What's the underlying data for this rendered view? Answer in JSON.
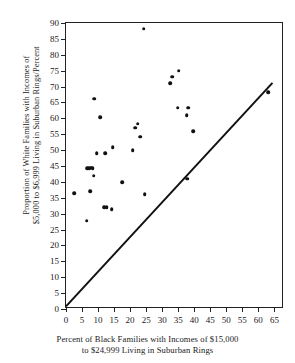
{
  "chart_data": {
    "type": "scatter",
    "title": "",
    "xlabel": "Percent of Black Families with Incomes of $15,000 to $24,999 Living in Suburban Rings",
    "xlabel_line1": "Percent of Black Families with Incomes of $15,000",
    "xlabel_line2": "to $24,999 Living in Suburban Rings",
    "ylabel": "Proportion of White Families with Incomes of $5,000 to $6,999 Living in Suburban Rings/Percent",
    "ylabel_line1": "Proportion of White Families with Incomes of",
    "ylabel_line2": "$5,000 to $6,999 Living in Suburban Rings/Percent",
    "xlim": [
      0,
      68
    ],
    "ylim": [
      0,
      90
    ],
    "xticks": [
      0,
      5,
      10,
      15,
      20,
      25,
      30,
      35,
      40,
      45,
      50,
      55,
      60,
      65
    ],
    "yticks": [
      0,
      5,
      10,
      15,
      20,
      25,
      30,
      35,
      40,
      45,
      50,
      55,
      60,
      65,
      70,
      75,
      80,
      85,
      90
    ],
    "grid": false,
    "legend": null,
    "marker": {
      "shape": "circle",
      "color": "#111111",
      "size": 3.6
    },
    "reference_line": {
      "description": "45-degree diagonal line of equality",
      "x": [
        0,
        65
      ],
      "y": [
        0,
        71
      ],
      "color": "#111111",
      "width": 2.0
    },
    "points": [
      {
        "x": 2.5,
        "y": 36.5
      },
      {
        "x": 6.5,
        "y": 27.8
      },
      {
        "x": 6.6,
        "y": 44.3
      },
      {
        "x": 7.2,
        "y": 44.4
      },
      {
        "x": 7.8,
        "y": 44.5
      },
      {
        "x": 8.3,
        "y": 44.4
      },
      {
        "x": 7.6,
        "y": 37.0
      },
      {
        "x": 8.6,
        "y": 42.0
      },
      {
        "x": 8.8,
        "y": 66.2
      },
      {
        "x": 9.6,
        "y": 49.0
      },
      {
        "x": 10.6,
        "y": 60.3
      },
      {
        "x": 11.9,
        "y": 32.0
      },
      {
        "x": 12.7,
        "y": 32.0
      },
      {
        "x": 12.2,
        "y": 49.1
      },
      {
        "x": 14.2,
        "y": 31.4
      },
      {
        "x": 14.6,
        "y": 50.9
      },
      {
        "x": 17.5,
        "y": 39.9
      },
      {
        "x": 20.8,
        "y": 50.0
      },
      {
        "x": 21.5,
        "y": 57.0
      },
      {
        "x": 22.4,
        "y": 58.3
      },
      {
        "x": 23.2,
        "y": 54.2
      },
      {
        "x": 24.2,
        "y": 88.2
      },
      {
        "x": 24.6,
        "y": 36.2
      },
      {
        "x": 32.5,
        "y": 71.0
      },
      {
        "x": 33.2,
        "y": 73.1
      },
      {
        "x": 34.9,
        "y": 63.4
      },
      {
        "x": 35.2,
        "y": 75.0
      },
      {
        "x": 37.6,
        "y": 60.9
      },
      {
        "x": 38.2,
        "y": 63.3
      },
      {
        "x": 37.8,
        "y": 41.0
      },
      {
        "x": 39.6,
        "y": 56.0
      },
      {
        "x": 63.0,
        "y": 68.2
      }
    ]
  }
}
